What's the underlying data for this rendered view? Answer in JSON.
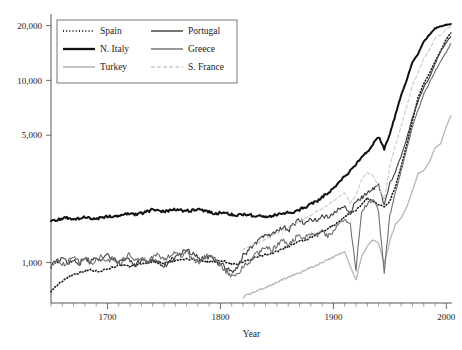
{
  "chart_data": {
    "type": "line",
    "title": "",
    "xlabel": "Year",
    "ylabel": "",
    "yscale": "log",
    "xlim": [
      1650,
      2005
    ],
    "ylim": [
      600,
      22000
    ],
    "grid": false,
    "legend_position": "top-left",
    "x_ticks": [
      1700,
      1800,
      1900,
      2000
    ],
    "x_tick_labels": [
      "1700",
      "1800",
      "1900",
      "2000"
    ],
    "x_minor_tick_step": 10,
    "y_ticks": [
      1000,
      5000,
      10000,
      20000
    ],
    "y_tick_labels": [
      "1,000",
      "5,000",
      "10,000",
      "20,000"
    ],
    "series": [
      {
        "name": "Spain",
        "style": "dotted",
        "color": "#1a1a1a",
        "width": 1.6,
        "x": [
          1650,
          1655,
          1660,
          1665,
          1670,
          1675,
          1680,
          1685,
          1690,
          1695,
          1700,
          1705,
          1710,
          1715,
          1720,
          1725,
          1730,
          1735,
          1740,
          1745,
          1750,
          1755,
          1760,
          1765,
          1770,
          1775,
          1780,
          1785,
          1790,
          1795,
          1800,
          1805,
          1810,
          1815,
          1820,
          1825,
          1830,
          1835,
          1840,
          1845,
          1850,
          1855,
          1860,
          1865,
          1870,
          1875,
          1880,
          1885,
          1890,
          1895,
          1900,
          1905,
          1910,
          1915,
          1920,
          1925,
          1930,
          1935,
          1940,
          1945,
          1950,
          1955,
          1960,
          1965,
          1970,
          1975,
          1980,
          1985,
          1990,
          1995,
          2000,
          2004
        ],
        "y": [
          700,
          745,
          790,
          835,
          860,
          880,
          900,
          910,
          895,
          905,
          925,
          945,
          965,
          960,
          950,
          965,
          985,
          1000,
          1010,
          1000,
          995,
          1005,
          1020,
          1035,
          1045,
          1040,
          1030,
          1020,
          1010,
          1015,
          1030,
          1010,
          985,
          975,
          1000,
          1030,
          1060,
          1085,
          1110,
          1120,
          1150,
          1195,
          1230,
          1265,
          1300,
          1330,
          1370,
          1420,
          1480,
          1530,
          1600,
          1680,
          1790,
          1860,
          1930,
          2090,
          2260,
          2180,
          2080,
          2010,
          2180,
          2620,
          3370,
          4450,
          6000,
          8080,
          9600,
          10900,
          12700,
          14500,
          16900,
          18200
        ]
      },
      {
        "name": "N. Italy",
        "style": "solid",
        "color": "#111111",
        "width": 2.0,
        "x": [
          1650,
          1655,
          1660,
          1665,
          1670,
          1675,
          1680,
          1685,
          1690,
          1695,
          1700,
          1705,
          1710,
          1715,
          1720,
          1725,
          1730,
          1735,
          1740,
          1745,
          1750,
          1755,
          1760,
          1765,
          1770,
          1775,
          1780,
          1785,
          1790,
          1795,
          1800,
          1805,
          1810,
          1815,
          1820,
          1825,
          1830,
          1835,
          1840,
          1845,
          1850,
          1855,
          1860,
          1865,
          1870,
          1875,
          1880,
          1885,
          1890,
          1895,
          1900,
          1905,
          1910,
          1915,
          1920,
          1925,
          1930,
          1935,
          1940,
          1945,
          1950,
          1955,
          1960,
          1965,
          1970,
          1975,
          1980,
          1985,
          1990,
          1995,
          2000,
          2004
        ],
        "y": [
          1720,
          1700,
          1740,
          1760,
          1730,
          1750,
          1780,
          1760,
          1740,
          1770,
          1790,
          1800,
          1820,
          1830,
          1850,
          1840,
          1870,
          1900,
          1960,
          1930,
          1900,
          1930,
          1950,
          1940,
          1920,
          1930,
          1950,
          1920,
          1890,
          1860,
          1880,
          1855,
          1830,
          1820,
          1840,
          1830,
          1810,
          1800,
          1790,
          1800,
          1830,
          1860,
          1880,
          1900,
          1950,
          2020,
          2090,
          2170,
          2280,
          2410,
          2560,
          2760,
          2980,
          3180,
          3480,
          3780,
          4050,
          4480,
          4900,
          4200,
          5100,
          6500,
          8300,
          10100,
          12600,
          14000,
          16300,
          17800,
          19300,
          19800,
          20200,
          20400
        ]
      },
      {
        "name": "Turkey",
        "style": "solid",
        "color": "#b5b5b5",
        "width": 1.3,
        "x": [
          1820,
          1830,
          1840,
          1850,
          1860,
          1870,
          1880,
          1890,
          1900,
          1910,
          1920,
          1925,
          1930,
          1935,
          1940,
          1945,
          1950,
          1955,
          1960,
          1965,
          1970,
          1975,
          1980,
          1985,
          1990,
          1995,
          2000,
          2004
        ],
        "y": [
          650,
          690,
          730,
          780,
          830,
          880,
          940,
          1000,
          1070,
          1150,
          800,
          1080,
          1220,
          1340,
          1280,
          980,
          1320,
          1620,
          1760,
          2020,
          2480,
          3080,
          3200,
          3560,
          4260,
          4500,
          5600,
          6400
        ]
      },
      {
        "name": "Portugal",
        "style": "solid",
        "color": "#3d3d3d",
        "width": 1.1,
        "x": [
          1650,
          1655,
          1660,
          1665,
          1670,
          1675,
          1680,
          1685,
          1690,
          1695,
          1700,
          1705,
          1710,
          1715,
          1720,
          1725,
          1730,
          1735,
          1740,
          1745,
          1750,
          1755,
          1760,
          1765,
          1770,
          1775,
          1780,
          1785,
          1790,
          1795,
          1800,
          1805,
          1810,
          1815,
          1820,
          1825,
          1830,
          1835,
          1840,
          1845,
          1850,
          1855,
          1860,
          1865,
          1870,
          1875,
          1880,
          1885,
          1890,
          1895,
          1900,
          1905,
          1910,
          1915,
          1920,
          1925,
          1930,
          1935,
          1940,
          1945,
          1950,
          1955,
          1960,
          1965,
          1970,
          1975,
          1980,
          1985,
          1990,
          1995,
          2000,
          2004
        ],
        "y": [
          960,
          1010,
          1070,
          980,
          1040,
          990,
          1060,
          1010,
          1080,
          1020,
          1090,
          1040,
          1000,
          1060,
          1020,
          970,
          1030,
          990,
          1050,
          1000,
          960,
          1010,
          1070,
          1120,
          1180,
          1130,
          1080,
          1040,
          1090,
          1010,
          980,
          940,
          880,
          920,
          1090,
          1180,
          1260,
          1350,
          1430,
          1390,
          1480,
          1580,
          1500,
          1620,
          1700,
          1640,
          1760,
          1690,
          1820,
          1760,
          1880,
          1960,
          2050,
          1880,
          2160,
          2280,
          2400,
          2520,
          2680,
          2050,
          2700,
          3200,
          3850,
          4800,
          6300,
          7700,
          9200,
          10300,
          12300,
          14500,
          16200,
          17400
        ]
      },
      {
        "name": "Greece",
        "style": "solid",
        "color": "#6e6e6e",
        "width": 1.1,
        "x": [
          1650,
          1655,
          1660,
          1665,
          1670,
          1675,
          1680,
          1685,
          1690,
          1695,
          1700,
          1705,
          1710,
          1715,
          1720,
          1725,
          1730,
          1735,
          1740,
          1745,
          1750,
          1755,
          1760,
          1765,
          1770,
          1775,
          1780,
          1785,
          1790,
          1795,
          1800,
          1805,
          1810,
          1815,
          1820,
          1825,
          1830,
          1835,
          1840,
          1845,
          1850,
          1855,
          1860,
          1865,
          1870,
          1875,
          1880,
          1885,
          1890,
          1895,
          1900,
          1905,
          1910,
          1915,
          1920,
          1925,
          1930,
          1935,
          1940,
          1945,
          1950,
          1955,
          1960,
          1965,
          1970,
          1975,
          1980,
          1985,
          1990,
          1995,
          2000,
          2004
        ],
        "y": [
          980,
          1040,
          960,
          1020,
          1090,
          1000,
          1060,
          980,
          1040,
          1100,
          1010,
          1070,
          990,
          1050,
          1110,
          1020,
          1080,
          1000,
          1060,
          1120,
          1030,
          1090,
          1150,
          1080,
          1140,
          1060,
          1000,
          1060,
          1120,
          1040,
          960,
          900,
          850,
          880,
          940,
          1010,
          1080,
          1150,
          1220,
          1160,
          1240,
          1320,
          1260,
          1340,
          1420,
          1360,
          1450,
          1380,
          1470,
          1400,
          1500,
          1620,
          1760,
          1620,
          920,
          1940,
          2080,
          2220,
          1900,
          890,
          1820,
          2400,
          3200,
          4200,
          5600,
          6900,
          8400,
          9700,
          11200,
          12800,
          14300,
          15900
        ]
      },
      {
        "name": "S. France",
        "style": "dashed",
        "color": "#c8c8c8",
        "width": 1.1,
        "x": [
          1820,
          1830,
          1840,
          1850,
          1860,
          1870,
          1880,
          1890,
          1900,
          1910,
          1915,
          1920,
          1925,
          1930,
          1935,
          1940,
          1945,
          1950,
          1955,
          1960,
          1965,
          1970,
          1975,
          1980,
          1985,
          1990,
          1995,
          2000,
          2004
        ],
        "y": [
          1180,
          1260,
          1350,
          1450,
          1560,
          1680,
          1820,
          1980,
          2180,
          2420,
          2100,
          2340,
          2860,
          3120,
          3000,
          2600,
          2200,
          3400,
          4400,
          5600,
          7200,
          9400,
          11000,
          13200,
          14800,
          17000,
          17800,
          19200,
          19600
        ]
      }
    ]
  },
  "legend": {
    "entries": [
      {
        "label": "Spain"
      },
      {
        "label": "Portugal"
      },
      {
        "label": "N. Italy"
      },
      {
        "label": "Greece"
      },
      {
        "label": "Turkey"
      },
      {
        "label": "S. France"
      }
    ]
  },
  "axes": {
    "x_title": "Year"
  }
}
